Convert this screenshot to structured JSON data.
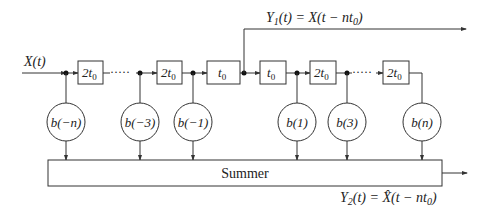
{
  "diagram": {
    "input_label": "X(t)",
    "delays": [
      {
        "id": "d1",
        "label_main": "2t",
        "label_sub": "0"
      },
      {
        "id": "d2",
        "label_main": "2t",
        "label_sub": "0"
      },
      {
        "id": "d3",
        "label_main": "t",
        "label_sub": "0"
      },
      {
        "id": "d4",
        "label_main": "t",
        "label_sub": "0"
      },
      {
        "id": "d5",
        "label_main": "2t",
        "label_sub": "0"
      },
      {
        "id": "d6",
        "label_main": "2t",
        "label_sub": "0"
      }
    ],
    "ellipsis": "·····",
    "taps": [
      {
        "label": "b(−n)"
      },
      {
        "label": "b(−3)"
      },
      {
        "label": "b(−1)"
      },
      {
        "label": "b(1)"
      },
      {
        "label": "b(3)"
      },
      {
        "label": "b(n)"
      }
    ],
    "summer_label": "Summer",
    "output1": {
      "prefix": "Y",
      "sub": "1",
      "rest": "(t) = X(t − nt",
      "sub2": "0",
      "end": ")"
    },
    "output2": {
      "prefix": "Y",
      "sub": "2",
      "rest": "(t) = X̂(t − nt",
      "sub2": "0",
      "end": ")"
    }
  }
}
